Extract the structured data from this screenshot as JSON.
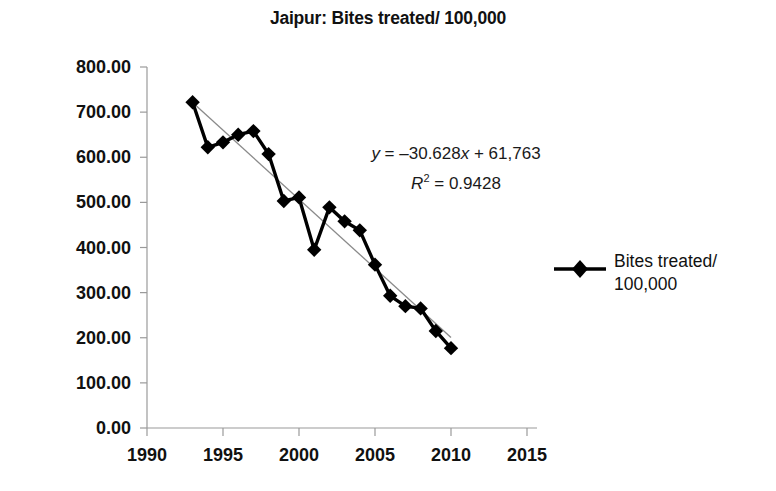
{
  "chart_data": {
    "type": "line",
    "title": "Jaipur: Bites treated/ 100,000",
    "xlabel": "",
    "ylabel": "",
    "xlim": [
      1990,
      2015
    ],
    "ylim": [
      0,
      800
    ],
    "grid": false,
    "legend_position": "right",
    "x_ticks": [
      "1990",
      "1995",
      "2000",
      "2005",
      "2010",
      "2015"
    ],
    "x_tick_values": [
      1990,
      1995,
      2000,
      2005,
      2010,
      2015
    ],
    "y_ticks": [
      "0.00",
      "100.00",
      "200.00",
      "300.00",
      "400.00",
      "500.00",
      "600.00",
      "700.00",
      "800.00"
    ],
    "y_tick_values": [
      0,
      100,
      200,
      300,
      400,
      500,
      600,
      700,
      800
    ],
    "series": [
      {
        "name": "Bites treated/ 100,000",
        "marker": "diamond",
        "color": "#000000",
        "x": [
          1993,
          1994,
          1995,
          1996,
          1997,
          1998,
          1999,
          2000,
          2001,
          2002,
          2003,
          2004,
          2005,
          2006,
          2007,
          2008,
          2009,
          2010
        ],
        "values": [
          722,
          622,
          633,
          650,
          658,
          607,
          503,
          511,
          395,
          489,
          458,
          438,
          362,
          293,
          270,
          265,
          215,
          177
        ]
      }
    ],
    "trendline": {
      "equation": "y = –30.628x + 61,763",
      "r_squared_label": "R² = 0.9428",
      "slope": -30.628,
      "intercept": 61763,
      "r_squared": 0.9428,
      "color": "#8a8a8a"
    },
    "annotations": [
      {
        "id": "equation",
        "text": "y = –30.628x + 61,763"
      },
      {
        "id": "r-squared",
        "text": "R² = 0.9428"
      }
    ],
    "legend": [
      {
        "label_line1": "Bites treated/",
        "label_line2": "100,000"
      }
    ]
  },
  "equation": {
    "y_symbol": "y",
    "eq_body": " = –30.628",
    "x_symbol": "x",
    "eq_tail": " + 61,763",
    "r_symbol": "R",
    "r_exp": "2",
    "r_value": " = 0.9428"
  },
  "legend": {
    "label_line1": "Bites treated/",
    "label_line2": "100,000"
  },
  "title": "Jaipur: Bites treated/ 100,000"
}
